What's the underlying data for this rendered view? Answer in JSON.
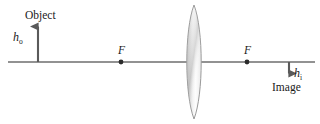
{
  "figure": {
    "type": "optics-ray-diagram",
    "width": 320,
    "height": 124,
    "background_color": "#ffffff"
  },
  "labels": {
    "object": "Object",
    "object_height": "h",
    "object_height_subscript": "o",
    "image": "Image",
    "image_height": "h",
    "image_height_subscript": "i",
    "focal_point_left": "F",
    "focal_point_right": "F"
  },
  "colors": {
    "axis": "#6e6e6e",
    "arrow": "#5a5a5a",
    "text": "#1a1a1a",
    "lens_outline": "#9a9a9a",
    "lens_fill_light": "#fdfdfd",
    "lens_fill_mid": "#d8d8d8",
    "lens_fill_dark": "#b9b9b9",
    "focal_dot": "#2b2b2b"
  },
  "geometry": {
    "optical_axis": {
      "x1": 8,
      "y": 62,
      "x2": 315
    },
    "lens": {
      "center_x": 194,
      "half_width": 9,
      "top_y": 5,
      "bottom_y": 119
    },
    "focal_point_left": {
      "x": 121,
      "y": 62,
      "radius": 2.4
    },
    "focal_point_right": {
      "x": 247,
      "y": 62,
      "radius": 2.4
    },
    "object_arrow": {
      "x": 38,
      "y_tail": 62,
      "y_head": 22
    },
    "image_arrow": {
      "x": 289,
      "y_tail": 62,
      "y_head": 79
    }
  }
}
